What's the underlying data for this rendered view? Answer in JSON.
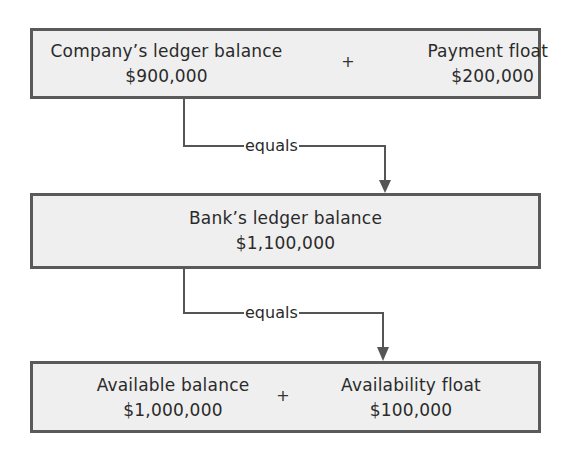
{
  "diagram": {
    "type": "float-reconciliation-flow",
    "boxes": [
      {
        "id": "company-ledger-equation",
        "terms": [
          {
            "label": "Company’s ledger balance",
            "value": "$900,000"
          },
          {
            "label": "Payment float",
            "value": "$200,000"
          }
        ],
        "operator": "+"
      },
      {
        "id": "bank-ledger",
        "terms": [
          {
            "label": "Bank’s ledger balance",
            "value": "$1,100,000"
          }
        ]
      },
      {
        "id": "available-equation",
        "terms": [
          {
            "label": "Available balance",
            "value": "$1,000,000"
          },
          {
            "label": "Availability float",
            "value": "$100,000"
          }
        ],
        "operator": "+"
      }
    ],
    "connectors": [
      {
        "from": "company-ledger-equation",
        "to": "bank-ledger",
        "label": "equals"
      },
      {
        "from": "bank-ledger",
        "to": "available-equation",
        "label": "equals"
      }
    ],
    "colors": {
      "box_fill": "#efefef",
      "box_border": "#5a5a5a",
      "line": "#555555",
      "text": "#2a2a2a"
    }
  }
}
